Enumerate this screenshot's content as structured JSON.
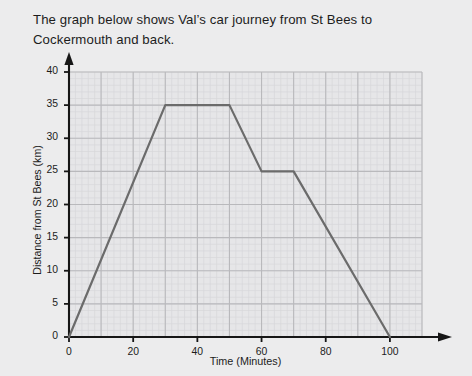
{
  "prompt": {
    "line1": "The graph below shows Val’s car journey from St Bees to",
    "line2": "Cockermouth and back."
  },
  "chart_data": {
    "type": "line",
    "title": "",
    "xlabel": "Time (Minutes)",
    "ylabel": "Distance from St Bees (km)",
    "xlim": [
      0,
      110
    ],
    "ylim": [
      0,
      40
    ],
    "xticks": [
      0,
      20,
      40,
      60,
      80,
      100
    ],
    "yticks": [
      0,
      5,
      10,
      15,
      20,
      25,
      30,
      35,
      40
    ],
    "xtick_labels": [
      "0",
      "20",
      "40",
      "60",
      "80",
      "100"
    ],
    "ytick_labels": [
      "0",
      "5",
      "10",
      "15",
      "20",
      "25",
      "30",
      "35",
      "40"
    ],
    "grid": true,
    "grid_major_step_x": 10,
    "grid_major_step_y": 5,
    "grid_minor_step_x": 2,
    "grid_minor_step_y": 1,
    "legend": null,
    "series": [
      {
        "name": "Val's car journey",
        "color": "#6b6b6b",
        "x": [
          0,
          30,
          50,
          60,
          70,
          100
        ],
        "y": [
          0,
          35,
          35,
          25,
          25,
          0
        ],
        "points": [
          {
            "x": 0,
            "y": 0
          },
          {
            "x": 30,
            "y": 35
          },
          {
            "x": 50,
            "y": 35
          },
          {
            "x": 60,
            "y": 25
          },
          {
            "x": 70,
            "y": 25
          },
          {
            "x": 100,
            "y": 0
          }
        ]
      }
    ]
  },
  "colors": {
    "background": "#ececed",
    "line": "#6b6b6b",
    "axis": "#161616",
    "grid_major": "#b9b9bc",
    "grid_minor": "#d7d7da",
    "plot_background": "#e6e6e8"
  }
}
